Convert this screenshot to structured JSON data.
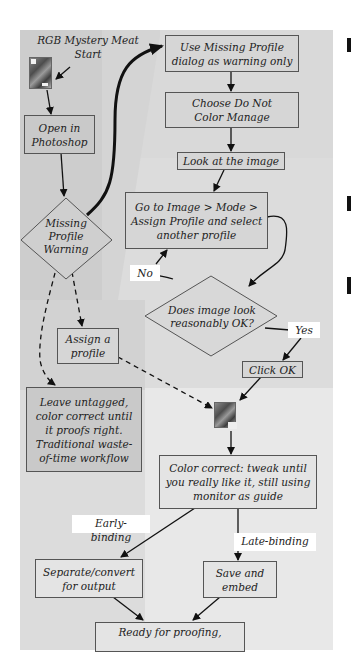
{
  "diagram": {
    "type": "flowchart",
    "start": {
      "text": "RGB Mystery Meat\nStart",
      "icon": "image-thumbnail-icon"
    },
    "nodes": {
      "open_photoshop": "Open in\nPhotoshop",
      "missing_profile_warning": "Missing\nProfile\nWarning",
      "use_dialog_warning": "Use Missing Profile\ndialog as warning only",
      "do_not_color_manage": "Choose Do Not\nColor Manage",
      "look_at_image": "Look at the image",
      "assign_other_profile": "Go to Image > Mode >\nAssign Profile and select\nanother profile",
      "image_ok_decision": "Does image look\nreasonably OK?",
      "click_ok": "Click OK",
      "assign_profile": "Assign a\nprofile",
      "leave_untagged": "Leave untagged,\ncolor correct until\nit proofs right.\nTraditional waste-\nof-time workflow",
      "tagged_image": {
        "icon": "tagged-image-thumbnail-icon"
      },
      "color_correct": "Color correct: tweak until\nyou really like it, still using\nmonitor as guide",
      "separate_convert": "Separate/convert\nfor output",
      "save_embed": "Save and\nembed",
      "ready_proofing": "Ready for proofing,"
    },
    "edge_labels": {
      "no": "No",
      "yes": "Yes",
      "early_binding": "Early-binding",
      "late_binding": "Late-binding"
    },
    "edges": [
      {
        "from": "start",
        "to": "open_photoshop",
        "style": "solid"
      },
      {
        "from": "open_photoshop",
        "to": "missing_profile_warning",
        "style": "solid"
      },
      {
        "from": "missing_profile_warning",
        "to": "use_dialog_warning",
        "style": "bold"
      },
      {
        "from": "use_dialog_warning",
        "to": "do_not_color_manage",
        "style": "solid"
      },
      {
        "from": "do_not_color_manage",
        "to": "look_at_image",
        "style": "solid"
      },
      {
        "from": "look_at_image",
        "to": "assign_other_profile",
        "style": "solid"
      },
      {
        "from": "assign_other_profile",
        "to": "image_ok_decision",
        "style": "solid"
      },
      {
        "from": "image_ok_decision",
        "to": "assign_other_profile",
        "label": "No",
        "style": "solid"
      },
      {
        "from": "image_ok_decision",
        "to": "click_ok",
        "label": "Yes",
        "style": "solid"
      },
      {
        "from": "click_ok",
        "to": "tagged_image",
        "style": "solid"
      },
      {
        "from": "missing_profile_warning",
        "to": "assign_profile",
        "style": "dashed"
      },
      {
        "from": "missing_profile_warning",
        "to": "leave_untagged",
        "style": "dashed"
      },
      {
        "from": "assign_profile",
        "to": "tagged_image",
        "style": "dashed"
      },
      {
        "from": "tagged_image",
        "to": "color_correct",
        "style": "solid"
      },
      {
        "from": "color_correct",
        "to": "separate_convert",
        "label": "Early-binding",
        "style": "solid"
      },
      {
        "from": "color_correct",
        "to": "save_embed",
        "label": "Late-binding",
        "style": "solid"
      },
      {
        "from": "separate_convert",
        "to": "ready_proofing",
        "style": "solid"
      },
      {
        "from": "save_embed",
        "to": "ready_proofing",
        "style": "solid"
      }
    ],
    "colors": {
      "panel_bg": "#dcdcdc",
      "node_bg": "#d6d6d6",
      "node_border": "#555555",
      "label_bg": "#ffffff",
      "line": "#111111"
    }
  }
}
